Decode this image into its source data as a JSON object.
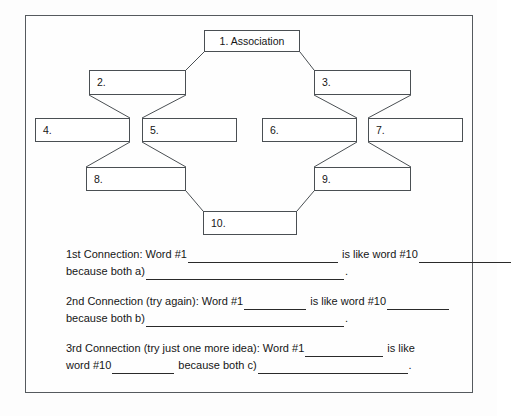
{
  "worksheet": {
    "title": "Association Word Connection Worksheet",
    "diagram": {
      "type": "tree",
      "nodes": [
        {
          "id": "n1",
          "label": "1. Association",
          "x": 204,
          "y": 30,
          "w": 96,
          "h": 22,
          "centered": true
        },
        {
          "id": "n2",
          "label": "2.",
          "x": 89,
          "y": 70,
          "w": 97,
          "h": 25,
          "centered": false
        },
        {
          "id": "n3",
          "label": "3.",
          "x": 314,
          "y": 70,
          "w": 97,
          "h": 25,
          "centered": false
        },
        {
          "id": "n4",
          "label": "4.",
          "x": 35,
          "y": 118,
          "w": 95,
          "h": 24,
          "centered": false
        },
        {
          "id": "n5",
          "label": "5.",
          "x": 142,
          "y": 118,
          "w": 95,
          "h": 24,
          "centered": false
        },
        {
          "id": "n6",
          "label": "6.",
          "x": 262,
          "y": 118,
          "w": 95,
          "h": 24,
          "centered": false
        },
        {
          "id": "n7",
          "label": "7.",
          "x": 368,
          "y": 118,
          "w": 95,
          "h": 24,
          "centered": false
        },
        {
          "id": "n8",
          "label": "8.",
          "x": 86,
          "y": 167,
          "w": 100,
          "h": 24,
          "centered": false
        },
        {
          "id": "n9",
          "label": "9.",
          "x": 314,
          "y": 167,
          "w": 97,
          "h": 24,
          "centered": false
        },
        {
          "id": "n10",
          "label": "10.",
          "x": 203,
          "y": 211,
          "w": 94,
          "h": 24,
          "centered": false
        }
      ],
      "edges": [
        {
          "from": "n1",
          "to": "n2"
        },
        {
          "from": "n1",
          "to": "n3"
        },
        {
          "from": "n2",
          "to": "n4"
        },
        {
          "from": "n2",
          "to": "n5"
        },
        {
          "from": "n3",
          "to": "n6"
        },
        {
          "from": "n3",
          "to": "n7"
        },
        {
          "from": "n4",
          "to": "n8"
        },
        {
          "from": "n5",
          "to": "n8"
        },
        {
          "from": "n6",
          "to": "n9"
        },
        {
          "from": "n7",
          "to": "n9"
        },
        {
          "from": "n8",
          "to": "n10"
        },
        {
          "from": "n9",
          "to": "n10"
        }
      ]
    },
    "prompts": {
      "first": {
        "line1_a": "1st Connection: Word #1",
        "line1_b": "is like word #10",
        "line2_a": "because both a)",
        "line2_b": "."
      },
      "second": {
        "line1_a": "2nd Connection (try again): Word #1",
        "line1_b": "is like word #10",
        "line2_a": "because both b)",
        "line2_b": "."
      },
      "third": {
        "line1_a": "3rd Connection (try just one more idea):  Word #1",
        "line1_b": "is like",
        "line2_a": "word #10",
        "line2_b": "because both c)",
        "line2_c": "."
      }
    },
    "colors": {
      "border": "#555a5e",
      "box_border": "#4a4f53",
      "text": "#161616",
      "background": "#fefefe"
    }
  }
}
